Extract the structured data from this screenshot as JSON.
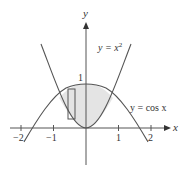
{
  "figure": {
    "type": "area-between-curves",
    "axes": {
      "x_label": "x",
      "y_label": "y",
      "x_ticks": [
        {
          "value": -2,
          "label": "−2"
        },
        {
          "value": -1,
          "label": "−1"
        },
        {
          "value": 1,
          "label": "1"
        },
        {
          "value": 2,
          "label": "2"
        }
      ],
      "y_ticks": [
        {
          "value": 1,
          "label": "1"
        }
      ]
    },
    "curves": [
      {
        "name": "parabola",
        "label_prefix": "y = ",
        "label_var": "x",
        "label_exp": "2",
        "expression": "x^2"
      },
      {
        "name": "cosine",
        "label": "y = cos x",
        "expression": "cos x"
      }
    ],
    "shaded_region": "between y = cos x (top) and y = x^2 (bottom), approx -0.824 <= x <= 0.824",
    "approximating_rectangle": {
      "x_from": -0.55,
      "x_to": -0.34
    },
    "colors": {
      "line": "#555555",
      "fill": "#e4e4e4",
      "text": "#333333",
      "background": "#ffffff"
    }
  }
}
